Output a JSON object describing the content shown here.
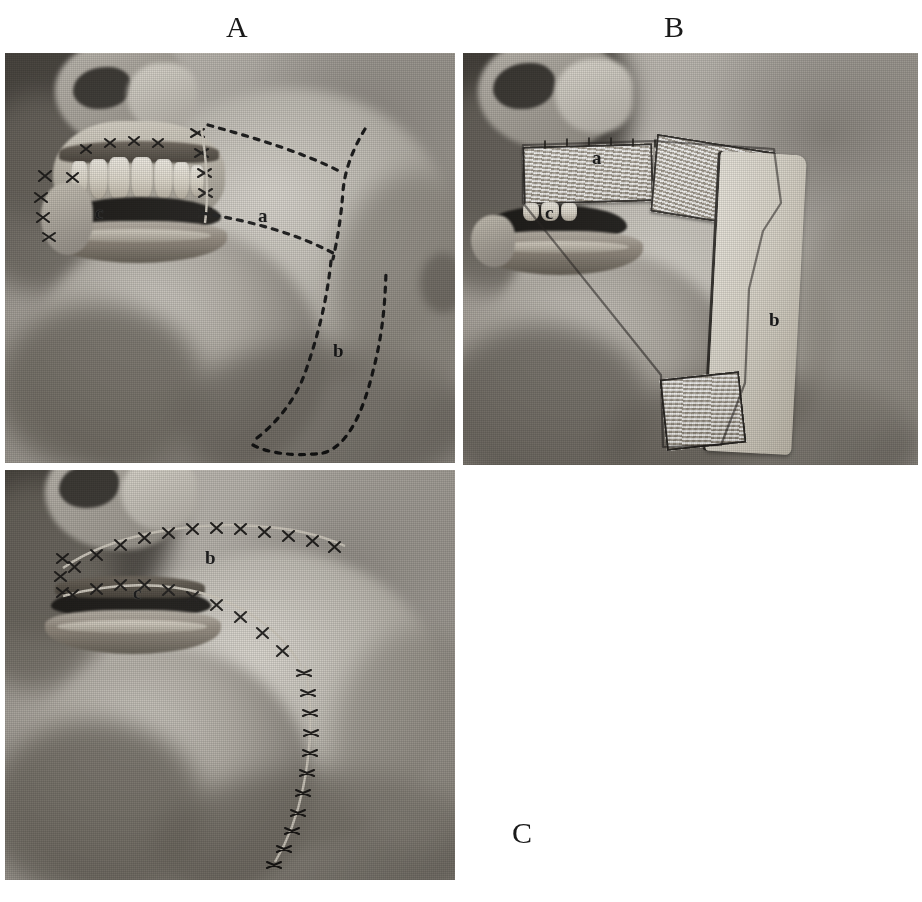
{
  "plate": {
    "width": 922,
    "height": 902,
    "background_color": "#ffffff",
    "ink_color": "#121212",
    "description": "Three-panel halftone surgical photograph plate showing a cheek and neck flap reconstruction of the lip and oral commissure in profile view."
  },
  "panel_letters": [
    {
      "id": "A",
      "label": "A",
      "x": 226,
      "y": 12
    },
    {
      "id": "B",
      "label": "B",
      "x": 664,
      "y": 12
    },
    {
      "id": "C",
      "label": "C",
      "x": 512,
      "y": 818
    }
  ],
  "panels": [
    {
      "id": "A",
      "letter": "A",
      "caption": "Outline of the proposed cheek flap (a) and neck flap (b) marked in dotted lines; sutured defect at the commissure (c).",
      "frame": {
        "x": 5,
        "y": 53,
        "w": 450,
        "h": 410
      },
      "markers": [
        {
          "label": "a",
          "x": 258,
          "y": 161,
          "meaning": "upper cheek flap outline"
        },
        {
          "label": "b",
          "x": 332,
          "y": 295,
          "meaning": "lower neck flap outline"
        },
        {
          "label": "c",
          "x": 95,
          "y": 158,
          "meaning": "sutured oral commissure defect"
        }
      ],
      "incision_style": "dotted",
      "has_sutures": true,
      "has_dotted_outline": true,
      "teeth_visible": true
    },
    {
      "id": "B",
      "letter": "B",
      "caption": "Flaps raised and turned: cheek flap (a) reflected with raw surface upward, neck flap (b) elevated on its inferior pedicle; commissure (c).",
      "frame": {
        "x": 463,
        "y": 53,
        "w": 455,
        "h": 412
      },
      "markers": [
        {
          "label": "a",
          "x": 592,
          "y": 148,
          "meaning": "elevated cheek flap, raw surface"
        },
        {
          "label": "b",
          "x": 769,
          "y": 310,
          "meaning": "elevated neck flap"
        },
        {
          "label": "c",
          "x": 545,
          "y": 203,
          "meaning": "oral commissure"
        }
      ],
      "incision_style": "solid",
      "has_sutures": true,
      "has_dotted_outline": false,
      "teeth_visible": true
    },
    {
      "id": "C",
      "letter": "C",
      "caption": "Result after transposition and closure: suture line of the transposed flap (b) and the reconstructed commissure (c).",
      "frame": {
        "x": 5,
        "y": 470,
        "w": 450,
        "h": 410
      },
      "markers": [
        {
          "label": "b",
          "x": 208,
          "y": 555,
          "meaning": "suture line of transposed flap"
        },
        {
          "label": "c",
          "x": 135,
          "y": 590,
          "meaning": "reconstructed oral commissure"
        }
      ],
      "incision_style": "sutured",
      "has_sutures": true,
      "has_dotted_outline": false,
      "teeth_visible": false
    }
  ],
  "artifacts": [
    {
      "name": "plate-speck",
      "label": "’",
      "x": 893,
      "y": 423
    }
  ]
}
